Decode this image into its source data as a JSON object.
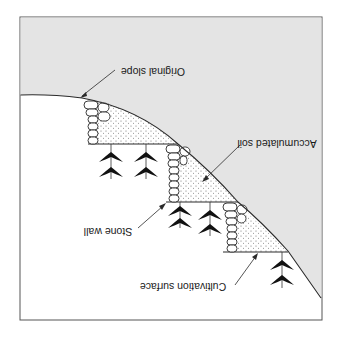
{
  "diagram": {
    "orientation": "rotated 180 degrees",
    "colors": {
      "background": "#ffffff",
      "upper_region": "#e4e4e4",
      "line": "#2a2a2a",
      "plant": "#111111",
      "soil_dot": "#6a6a6a"
    },
    "labels": {
      "original_slope": "Original slope",
      "accumulated_soil": "Accumulated soil",
      "stone_wall": "Stone wall",
      "cultivation_surface": "Cultivation surface"
    },
    "terraces": [
      {
        "id": 1,
        "plants": 2
      },
      {
        "id": 2,
        "plants": 2
      },
      {
        "id": 3,
        "plants": 1
      }
    ]
  }
}
